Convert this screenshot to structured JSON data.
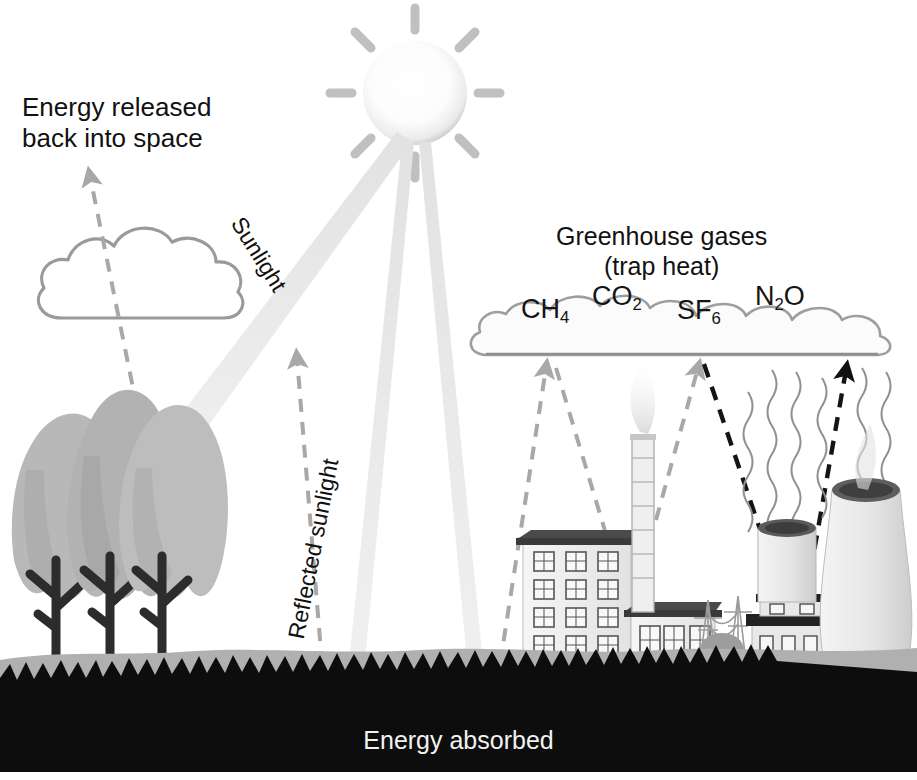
{
  "diagram": {
    "background_color": "#ffffff"
  },
  "labels": {
    "energy_released": "Energy released\nback into space",
    "greenhouse_gases": "Greenhouse gases\n(trap heat)",
    "sunlight": "Sunlight",
    "reflected_sunlight": "Reflected sunlight",
    "energy_absorbed": "Energy absorbed"
  },
  "gases": [
    {
      "name": "methane",
      "formula_main": "CH",
      "formula_sub": "4"
    },
    {
      "name": "carbon-dioxide",
      "formula_main": "CO",
      "formula_sub": "2"
    },
    {
      "name": "sulfur-hexafluoride",
      "formula_main": "SF",
      "formula_sub": "6"
    },
    {
      "name": "nitrous-oxide",
      "formula_main": "N",
      "formula_sub": "2",
      "formula_tail": "O"
    }
  ],
  "colors": {
    "sun": "#fdfdfd",
    "sun_ray": "#bdbdbd",
    "sunbeam": "#ededed",
    "cloud_outline": "#9a9a9a",
    "cloud_fill": "#ffffff",
    "tree_canopy": "#b5b5b5",
    "tree_canopy_dark": "#9c9c9c",
    "tree_trunk": "#2e2e2e",
    "ground_light": "#b0b0b0",
    "ground_dark": "#0d0d0d",
    "building_wall": "#efefef",
    "building_roof": "#3c3c3c",
    "arrow_gray": "#a8a8a8",
    "arrow_black": "#111111",
    "heat_wave": "#8f8f8f",
    "smoke": "#d6d6d6",
    "text_dark": "#111111",
    "text_light": "#f2f2f2"
  },
  "scene": {
    "sun": {
      "cx": 415,
      "cy": 93,
      "r": 52,
      "ray_count": 8
    },
    "sunbeams": [
      {
        "name": "beam-to-trees",
        "from": [
          400,
          140
        ],
        "to": [
          155,
          462
        ]
      },
      {
        "name": "beam-to-ground-left",
        "from": [
          408,
          148
        ],
        "to": [
          356,
          690
        ]
      },
      {
        "name": "beam-to-ground-right",
        "from": [
          424,
          148
        ],
        "to": [
          474,
          690
        ]
      }
    ],
    "cloud_left": {
      "cx": 140,
      "cy": 275,
      "w": 190,
      "h": 90
    },
    "cloud_greenhouse": {
      "x": 478,
      "y": 300,
      "w": 410,
      "h": 60
    },
    "trees": [
      {
        "x": 48,
        "y": 560
      },
      {
        "x": 92,
        "y": 560
      },
      {
        "x": 134,
        "y": 560
      }
    ],
    "ground": {
      "light_top": 648,
      "dark_top": 672,
      "bottom": 772
    },
    "factory": {
      "x": 520,
      "y": 535,
      "stack_x": 632
    },
    "power_plant": {
      "tower_x": 832,
      "building_x": 760
    },
    "arrows_gray_dashed": [
      {
        "name": "arrow-released-to-space",
        "from": [
          140,
          440
        ],
        "to": [
          88,
          168
        ]
      },
      {
        "name": "arrow-reflected-up",
        "from": [
          318,
          660
        ],
        "to": [
          298,
          352
        ]
      },
      {
        "name": "arrow-factory-to-cloud",
        "from": [
          505,
          655
        ],
        "to": [
          548,
          362
        ]
      },
      {
        "name": "arrow-cloud-to-factory",
        "from": [
          552,
          362
        ],
        "to": [
          628,
          600
        ]
      },
      {
        "name": "arrow-stack-to-cloud",
        "from": [
          660,
          490
        ],
        "to": [
          698,
          362
        ]
      }
    ],
    "arrows_black_dashed": [
      {
        "name": "arrow-cloud-to-power-plant",
        "from": [
          706,
          360
        ],
        "to": [
          790,
          622
        ]
      },
      {
        "name": "arrow-power-plant-to-cloud",
        "from": [
          800,
          625
        ],
        "to": [
          848,
          362
        ]
      }
    ],
    "heat_waves": {
      "count": 6,
      "x_start": 772,
      "x_end": 900,
      "top": 370,
      "bottom": 600
    }
  }
}
